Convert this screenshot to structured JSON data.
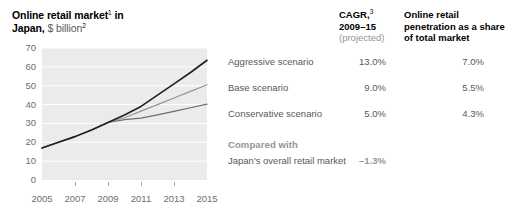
{
  "title": {
    "line1": "Online retail market",
    "sup1": "1",
    "line1_end": " in",
    "line2_bold": "Japan,",
    "line2_light": " $ billion",
    "sup2": "2"
  },
  "headers": {
    "cagr": "CAGR,",
    "cagr_sup": "3",
    "cagr_years": "2009–15",
    "cagr_note": "(projected)",
    "penetration": "Online retail penetration as a share of total market"
  },
  "rows": [
    {
      "label": "Aggressive scenario",
      "cagr": "13.0%",
      "penetration": "7.0%",
      "color": "#231f20"
    },
    {
      "label": "Base scenario",
      "cagr": "9.0%",
      "penetration": "5.5%",
      "color": "#939598"
    },
    {
      "label": "Conservative scenario",
      "cagr": "5.0%",
      "penetration": "4.3%",
      "color": "#6d6e71"
    }
  ],
  "compared": {
    "title": "Compared with",
    "label": "Japan's overall retail market",
    "value": "–1.3%"
  },
  "colors": {
    "plot_background": "#ebebeb",
    "gridline": "#ffffff",
    "axis_text": "#6d6e71",
    "body_text": "#58595b",
    "muted_text": "#939598",
    "heading_text": "#000000"
  },
  "chart_data": {
    "type": "line",
    "xlabel": "",
    "ylabel": "$ billion",
    "x": [
      2005,
      2006,
      2007,
      2008,
      2009,
      2010,
      2011,
      2012,
      2013,
      2014,
      2015
    ],
    "xticks": [
      "2005",
      "2007",
      "2009",
      "2011",
      "2013",
      "2015"
    ],
    "xlim": [
      2005,
      2015
    ],
    "ylim": [
      0,
      70
    ],
    "yticks": [
      0,
      10,
      20,
      30,
      40,
      50,
      60,
      70
    ],
    "grid": true,
    "legend_position": "right",
    "series": [
      {
        "name": "Aggressive scenario",
        "color": "#231f20",
        "cagr": "13.0%",
        "penetration": "7.0%",
        "values": [
          17.0,
          20.0,
          23.0,
          26.5,
          30.5,
          34.5,
          39.0,
          45.0,
          51.0,
          57.0,
          63.5
        ]
      },
      {
        "name": "Base scenario",
        "color": "#939598",
        "cagr": "9.0%",
        "penetration": "5.5%",
        "values": [
          17.0,
          20.0,
          23.0,
          26.5,
          30.5,
          33.0,
          36.5,
          40.0,
          43.5,
          47.0,
          50.5
        ]
      },
      {
        "name": "Conservative scenario",
        "color": "#6d6e71",
        "cagr": "5.0%",
        "penetration": "4.3%",
        "values": [
          17.0,
          20.0,
          23.0,
          26.5,
          30.5,
          32.0,
          32.8,
          34.5,
          36.4,
          38.3,
          40.2
        ]
      }
    ],
    "annotations": [
      {
        "text": "Japan's overall retail market",
        "value": "–1.3%",
        "group": "Compared with"
      }
    ]
  }
}
